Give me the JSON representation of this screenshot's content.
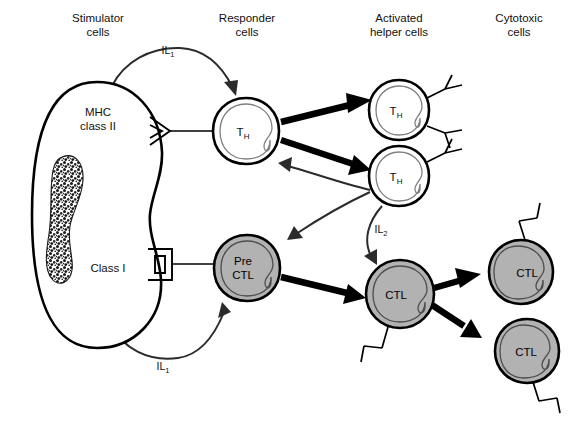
{
  "figure": {
    "width": 588,
    "height": 436,
    "background": "#ffffff"
  },
  "colors": {
    "cell_fill_white": "#ffffff",
    "cell_fill_gray": "#b2b2b2",
    "outline": "#000000",
    "nucleus_stroke": "#808080",
    "thin_arrow": "#2b2b2b",
    "thick_arrow": "#000000",
    "text": "#111111"
  },
  "columns": [
    {
      "id": "stimulator",
      "line1": "Stimulator",
      "line2": "cells",
      "x": 98
    },
    {
      "id": "responder",
      "line1": "Responder",
      "line2": "cells",
      "x": 247
    },
    {
      "id": "activated-helper",
      "line1": "Activated",
      "line2": "helper cells",
      "x": 399
    },
    {
      "id": "cytotoxic",
      "line1": "Cytotoxic",
      "line2": "cells",
      "x": 519
    }
  ],
  "cells": {
    "stimulator": {
      "name": "stimulator-cell",
      "mhc_class_ii": "MHC",
      "mhc_class_ii_line2": "class II",
      "class_i": "Class I",
      "cx": 97,
      "cy": 215
    },
    "responder_th": {
      "name": "responder-th-cell",
      "label": "T",
      "sublabel": "H",
      "cx": 246,
      "cy": 131,
      "r": 33
    },
    "pre_ctl": {
      "name": "pre-ctl-cell",
      "label_line1": "Pre",
      "label_line2": "CTL",
      "cx": 247,
      "cy": 268,
      "r": 33
    },
    "activated_th_top": {
      "name": "activated-th-cell-top",
      "label": "T",
      "sublabel": "H",
      "cx": 399,
      "cy": 110,
      "r": 30
    },
    "activated_th_bottom": {
      "name": "activated-th-cell-bottom",
      "label": "T",
      "sublabel": "H",
      "cx": 399,
      "cy": 176,
      "r": 30
    },
    "ctl_center": {
      "name": "ctl-cell-center",
      "label": "CTL",
      "cx": 400,
      "cy": 294,
      "r": 34
    },
    "ctl_top_right": {
      "name": "ctl-cell-top-right",
      "label": "CTL",
      "cx": 521,
      "cy": 272,
      "r": 32
    },
    "ctl_bottom_right": {
      "name": "ctl-cell-bottom-right",
      "label": "CTL",
      "cx": 527,
      "cy": 351,
      "r": 32
    }
  },
  "signals": [
    {
      "id": "il1-top",
      "label": "IL",
      "subscript": "1",
      "x": 168,
      "y": 54,
      "from": "stimulator",
      "to": "responder-th"
    },
    {
      "id": "il1-bottom",
      "label": "IL",
      "subscript": "1",
      "x": 163,
      "y": 365,
      "from": "stimulator",
      "to": "pre-ctl"
    },
    {
      "id": "il2",
      "label": "IL",
      "subscript": "2",
      "x": 381,
      "y": 229,
      "from": "activated-th-bottom",
      "to": "ctl-center"
    }
  ],
  "receptors": {
    "mhc_class_ii": {
      "name": "mhc-class-ii-receptor",
      "shape": "chevron",
      "x": 154,
      "y": 131
    },
    "class_i": {
      "name": "class-i-receptor",
      "shape": "square-bracket",
      "x": 155,
      "y": 264
    }
  }
}
